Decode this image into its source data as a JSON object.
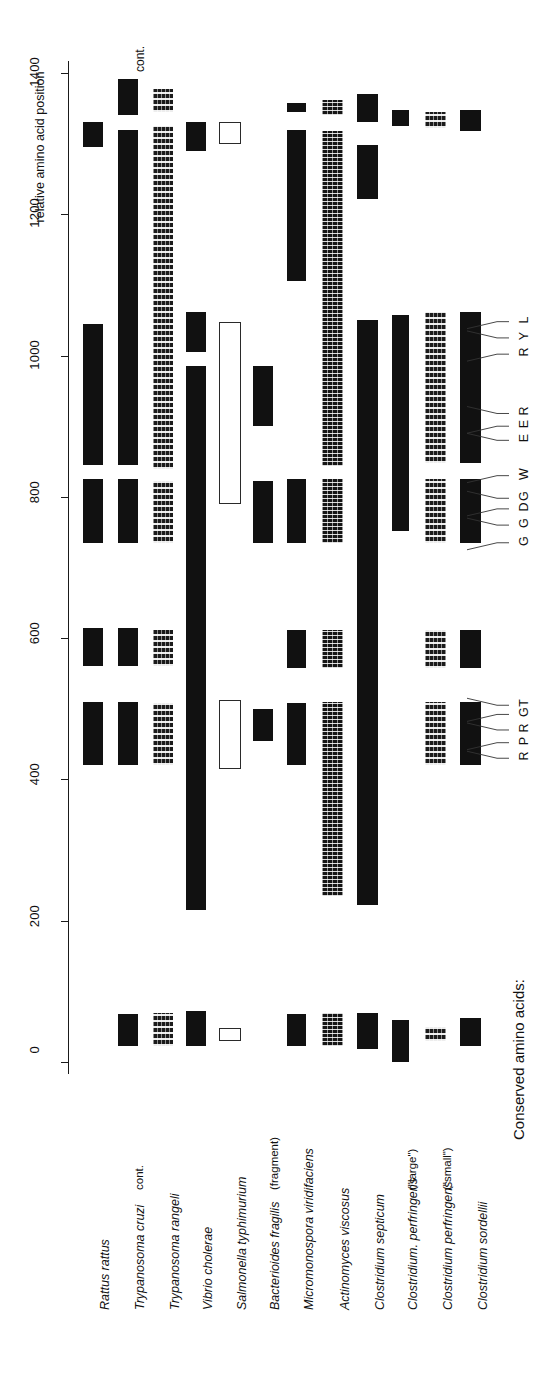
{
  "figure": {
    "axis_title": "relative amino acid position",
    "legend_title": "Conserved amino acids:",
    "continues_label": "cont."
  },
  "chart_data": {
    "type": "bar",
    "title": "relative amino acid position",
    "xlabel": "",
    "ylabel": "relative amino acid position",
    "orientation": "vertical-bars-rotated",
    "axis": {
      "ticks": [
        0,
        200,
        400,
        600,
        800,
        1000,
        1200,
        1400
      ],
      "tick_labels": [
        "0",
        "200",
        "400",
        "600",
        "800",
        "1000",
        "1200",
        "1400"
      ],
      "range": [
        0,
        1450
      ],
      "grid": false
    },
    "legend": {
      "position": "bottom-right",
      "title": "Conserved amino acids:",
      "entries": [
        "R",
        "P",
        "R",
        "G",
        "T",
        "G",
        "G",
        "D",
        "G",
        "W",
        "E",
        "E",
        "R",
        "R",
        "Y",
        "L"
      ]
    },
    "conserved_residues": [
      {
        "letter": "R",
        "position": 430
      },
      {
        "letter": "P",
        "position": 452
      },
      {
        "letter": "R",
        "position": 470
      },
      {
        "letter": "G",
        "position": 492
      },
      {
        "letter": "T",
        "position": 505
      },
      {
        "letter": "G",
        "position": 735
      },
      {
        "letter": "G",
        "position": 760
      },
      {
        "letter": "D",
        "position": 783
      },
      {
        "letter": "G",
        "position": 798
      },
      {
        "letter": "W",
        "position": 830
      },
      {
        "letter": "E",
        "position": 880
      },
      {
        "letter": "E",
        "position": 900
      },
      {
        "letter": "R",
        "position": 918
      },
      {
        "letter": "R",
        "position": 1002
      },
      {
        "letter": "Y",
        "position": 1025
      },
      {
        "letter": "L",
        "position": 1048
      }
    ],
    "categories": [
      "Rattus rattus",
      "Trypanosoma cruzi",
      "Trypanosoma rangeli",
      "Vibrio cholerae",
      "Salmonella typhimurium",
      "Bacterioides fragilis",
      "Micromonospora viridifaciens",
      "Actinomyces viscosus",
      "Clostridium septicum",
      "Clostridium. perfringens",
      "Clostridium perfringens",
      "Clostridium sordellii"
    ],
    "series": [
      {
        "name": "Rattus rattus",
        "note": "",
        "fill": "solid",
        "segments": [
          [
            1295,
            1330
          ],
          [
            845,
            1045
          ],
          [
            735,
            825
          ],
          [
            560,
            615
          ],
          [
            420,
            510
          ]
        ]
      },
      {
        "name": "Trypanosoma cruzi",
        "note": "cont.",
        "fill": "solid",
        "segments": [
          [
            1340,
            1392
          ],
          [
            845,
            1320
          ],
          [
            735,
            825
          ],
          [
            560,
            615
          ],
          [
            420,
            510
          ],
          [
            22,
            68
          ]
        ]
      },
      {
        "name": "Trypanosoma rangeli",
        "note": "",
        "fill": "speckle",
        "segments": [
          [
            1345,
            1378
          ],
          [
            840,
            1325
          ],
          [
            735,
            822
          ],
          [
            560,
            612
          ],
          [
            420,
            508
          ],
          [
            22,
            70
          ]
        ]
      },
      {
        "name": "Vibrio cholerae",
        "note": "",
        "fill": "solid",
        "segments": [
          [
            1290,
            1330
          ],
          [
            1005,
            1062
          ],
          [
            215,
            985
          ],
          [
            22,
            72
          ]
        ]
      },
      {
        "name": "Salmonella typhimurium",
        "note": "",
        "fill": "open",
        "segments": [
          [
            1300,
            1330
          ],
          [
            790,
            1048
          ],
          [
            415,
            512
          ],
          [
            30,
            48
          ]
        ]
      },
      {
        "name": "Bacterioides fragilis",
        "note": "(fragment)",
        "fill": "solid",
        "segments": [
          [
            900,
            985
          ],
          [
            735,
            823
          ],
          [
            455,
            500
          ]
        ]
      },
      {
        "name": "Micromonospora viridifaciens",
        "note": "",
        "fill": "solid",
        "segments": [
          [
            1345,
            1358
          ],
          [
            1105,
            1320
          ],
          [
            735,
            825
          ],
          [
            558,
            612
          ],
          [
            420,
            508
          ],
          [
            22,
            68
          ]
        ]
      },
      {
        "name": "Actinomyces viscosus",
        "note": "",
        "fill": "mottled",
        "segments": [
          [
            1340,
            1362
          ],
          [
            843,
            1318
          ],
          [
            735,
            825
          ],
          [
            558,
            612
          ],
          [
            235,
            510
          ],
          [
            22,
            70
          ]
        ]
      },
      {
        "name": "Clostridium septicum",
        "note": "",
        "fill": "solid",
        "segments": [
          [
            1330,
            1370
          ],
          [
            1222,
            1298
          ],
          [
            222,
            1050
          ],
          [
            18,
            70
          ]
        ]
      },
      {
        "name": "Clostridium. perfringens",
        "note": "(\"large\")",
        "fill": "solid",
        "segments": [
          [
            1325,
            1348
          ],
          [
            752,
            1058
          ],
          [
            0,
            60
          ]
        ]
      },
      {
        "name": "Clostridium perfringens",
        "note": "(\"small\")",
        "fill": "speckle",
        "segments": [
          [
            1322,
            1345
          ],
          [
            848,
            1062
          ],
          [
            735,
            825
          ],
          [
            558,
            612
          ],
          [
            420,
            510
          ],
          [
            30,
            50
          ]
        ]
      },
      {
        "name": "Clostridium sordellii",
        "note": "",
        "fill": "solid",
        "segments": [
          [
            1318,
            1348
          ],
          [
            848,
            1062
          ],
          [
            735,
            825
          ],
          [
            558,
            612
          ],
          [
            420,
            510
          ],
          [
            22,
            62
          ]
        ]
      }
    ]
  }
}
